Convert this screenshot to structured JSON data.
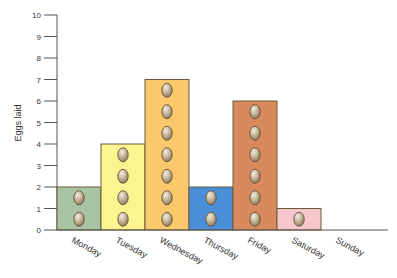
{
  "chart_data": {
    "type": "bar",
    "title": "",
    "xlabel": "",
    "ylabel": "Eggs laid",
    "categories": [
      "Monday",
      "Tuesday",
      "Wednesday",
      "Thursday",
      "Friday",
      "Saturday",
      "Sunday"
    ],
    "values": [
      2,
      4,
      7,
      2,
      6,
      1,
      0
    ],
    "ylim": [
      0,
      10
    ],
    "yticks": [
      0,
      1,
      2,
      3,
      4,
      5,
      6,
      7,
      8,
      9,
      10
    ],
    "grid": false,
    "legend": null,
    "bar_colors": [
      "#a9c4a4",
      "#fdf38f",
      "#fbc96b",
      "#4a90d9",
      "#d98a5c",
      "#f7c6cc",
      "#ffffff"
    ],
    "pictogram": "egg-icon",
    "pictogram_unit": 1
  },
  "colors": {
    "axis": "#555555",
    "bar_outline": "#6b5a3a",
    "egg_fill": "#c8b8a0",
    "egg_shade": "#8a7356",
    "egg_outline": "#5a4630"
  }
}
